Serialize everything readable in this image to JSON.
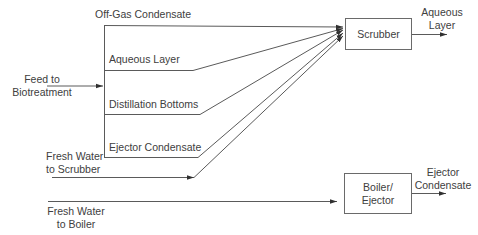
{
  "diagram": {
    "type": "process-flow",
    "nodes": {
      "scrubber": {
        "label": "Scrubber"
      },
      "boiler": {
        "label_line1": "Boiler/",
        "label_line2": "Ejector"
      }
    },
    "inputs": {
      "feed": {
        "line1": "Feed to",
        "line2": "Biotreatment"
      },
      "fresh_water_scrubber": {
        "line1": "Fresh Water",
        "line2": "to Scrubber"
      },
      "fresh_water_boiler": {
        "line1": "Fresh Water",
        "line2": "to Boiler"
      }
    },
    "streams": {
      "off_gas": "Off-Gas Condensate",
      "aqueous": "Aqueous Layer",
      "distillation": "Distillation Bottoms",
      "ejector": "Ejector Condensate"
    },
    "outputs": {
      "scrubber_out": {
        "line1": "Aqueous",
        "line2": "Layer"
      },
      "boiler_out": {
        "line1": "Ejector",
        "line2": "Condensate"
      }
    },
    "edges": [
      {
        "from": "Feed to Biotreatment",
        "to": "splitter"
      },
      {
        "from": "Off-Gas Condensate",
        "to": "Scrubber"
      },
      {
        "from": "Aqueous Layer",
        "to": "Scrubber"
      },
      {
        "from": "Distillation Bottoms",
        "to": "Scrubber"
      },
      {
        "from": "Ejector Condensate",
        "to": "Scrubber"
      },
      {
        "from": "Fresh Water to Scrubber",
        "to": "Scrubber"
      },
      {
        "from": "Scrubber",
        "to": "Aqueous Layer"
      },
      {
        "from": "Fresh Water to Boiler",
        "to": "Boiler/Ejector"
      },
      {
        "from": "Boiler/Ejector",
        "to": "Ejector Condensate"
      }
    ]
  }
}
